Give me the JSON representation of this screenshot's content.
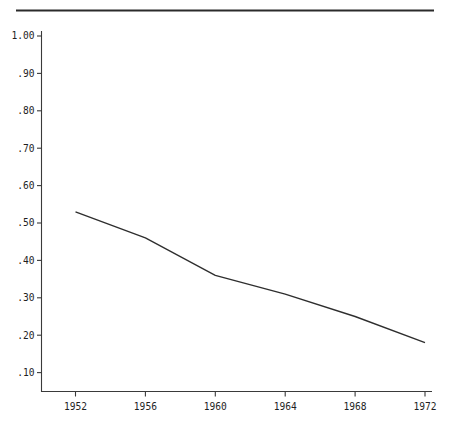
{
  "chart_data": {
    "type": "line",
    "title": "",
    "subtitle": "",
    "xlabel": "",
    "ylabel": "",
    "x": [
      1952,
      1956,
      1960,
      1964,
      1968,
      1972
    ],
    "categories": [
      "1952",
      "1956",
      "1960",
      "1964",
      "1968",
      "1972"
    ],
    "values": [
      0.53,
      0.46,
      0.36,
      0.31,
      0.25,
      0.18
    ],
    "series": [
      {
        "name": "",
        "values": [
          0.53,
          0.46,
          0.36,
          0.31,
          0.25,
          0.18
        ]
      }
    ],
    "xlim": [
      1950,
      1973.2
    ],
    "ylim": [
      0.0,
      1.0
    ],
    "grid": false,
    "legend": false,
    "legend_position": "none",
    "y_tick_labels": [
      "1.00",
      ".90",
      ".80",
      ".70",
      ".60",
      ".50",
      ".40",
      ".30",
      ".20",
      ".10"
    ],
    "y_tick_values": [
      1.0,
      0.9,
      0.8,
      0.7,
      0.6,
      0.5,
      0.4,
      0.3,
      0.2,
      0.1
    ],
    "x_tick_labels": [
      "1952",
      "1956",
      "1960",
      "1964",
      "1968",
      "1972"
    ],
    "x_tick_values": [
      1952,
      1956,
      1960,
      1964,
      1968,
      1972
    ],
    "annotations": [],
    "colors": {
      "line": "#2e2e2e",
      "axis": "#3a3a3a",
      "rule": "#2b2b2b",
      "text": "#1f1f1f",
      "background": "#ffffff"
    },
    "top_rule": true
  }
}
